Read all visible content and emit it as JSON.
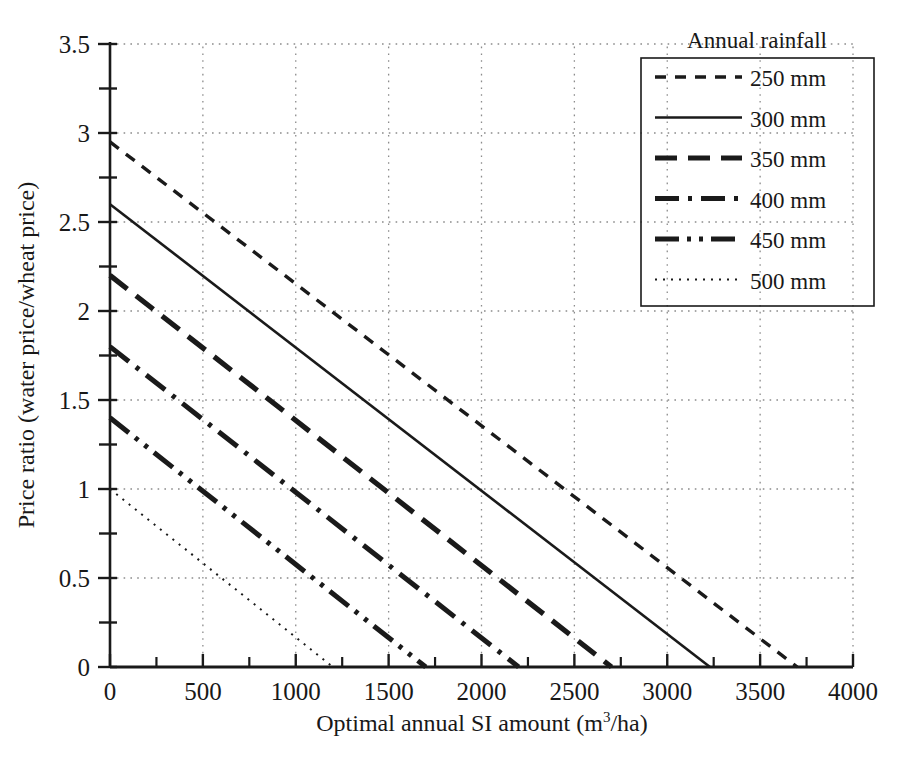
{
  "chart_data": {
    "type": "line",
    "title": "",
    "xlabel": "Optimal annual SI amount (m³/ha)",
    "ylabel": "Price ratio (water price/wheat price)",
    "xlim": [
      0,
      4000
    ],
    "ylim": [
      0,
      3.5
    ],
    "xticks": [
      0,
      500,
      1000,
      1500,
      2000,
      2500,
      3000,
      3500,
      4000
    ],
    "yticks": [
      0,
      0.5,
      1,
      1.5,
      2,
      2.5,
      3,
      3.5
    ],
    "xtick_labels": [
      "0",
      "500",
      "1000",
      "1500",
      "2000",
      "2500",
      "3000",
      "3500",
      "4000"
    ],
    "ytick_labels": [
      "0",
      "0.5",
      "1",
      "1.5",
      "2",
      "2.5",
      "3",
      "3.5"
    ],
    "xminor_step": 250,
    "yminor_step": 0.25,
    "grid": true,
    "grid_style": "dotted",
    "legend_position": "top-right",
    "legend_title": "Annual rainfall",
    "series": [
      {
        "name": "250 mm",
        "style": "short-dash",
        "dasharray": "11,9",
        "width": 3.4,
        "color": "#1a1a1a",
        "x": [
          0,
          3700
        ],
        "y": [
          2.95,
          0
        ]
      },
      {
        "name": "300 mm",
        "style": "solid",
        "dasharray": "",
        "width": 2.6,
        "color": "#1a1a1a",
        "x": [
          0,
          3230
        ],
        "y": [
          2.6,
          0
        ]
      },
      {
        "name": "350 mm",
        "style": "long-dash",
        "dasharray": "22,11",
        "width": 5.2,
        "color": "#1a1a1a",
        "x": [
          0,
          2700
        ],
        "y": [
          2.2,
          0
        ]
      },
      {
        "name": "400 mm",
        "style": "dash-dot",
        "dasharray": "24,9,4,9",
        "width": 5.0,
        "color": "#1a1a1a",
        "x": [
          0,
          2200
        ],
        "y": [
          1.8,
          0
        ]
      },
      {
        "name": "450 mm",
        "style": "dash-dot-dot",
        "dasharray": "24,8,4,8,4,8",
        "width": 5.0,
        "color": "#1a1a1a",
        "x": [
          0,
          1700
        ],
        "y": [
          1.4,
          0
        ]
      },
      {
        "name": "500 mm",
        "style": "fine-dot",
        "dasharray": "2,6",
        "width": 2.0,
        "color": "#1a1a1a",
        "x": [
          0,
          1200
        ],
        "y": [
          1.0,
          0
        ]
      }
    ]
  },
  "axes": {
    "x_title": "Optimal annual SI amount (m",
    "x_title_sup": "3",
    "x_title_tail": "/ha)",
    "y_title": "Price ratio (water price/wheat price)"
  },
  "legend": {
    "title": "Annual rainfall",
    "items": [
      {
        "label": "250 mm"
      },
      {
        "label": "300 mm"
      },
      {
        "label": "350 mm"
      },
      {
        "label": "400 mm"
      },
      {
        "label": "450 mm"
      },
      {
        "label": "500 mm"
      }
    ]
  },
  "colors": {
    "ink": "#1a1a1a",
    "grid": "#8c8c8c",
    "background": "#ffffff"
  }
}
